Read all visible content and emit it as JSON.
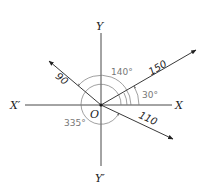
{
  "diagram": {
    "type": "vector force diagram",
    "origin": {
      "label": "O"
    },
    "axes": {
      "x_positive": "X",
      "x_negative": "X′",
      "y_positive": "Y",
      "y_negative": "Y′"
    },
    "vectors": [
      {
        "magnitude": "150",
        "angle": "30°",
        "angle_deg": 30
      },
      {
        "magnitude": "90",
        "angle": "140°",
        "angle_deg": 140
      },
      {
        "magnitude": "110",
        "angle": "335°",
        "angle_deg": 335
      }
    ],
    "colors": {
      "lines": "#222222",
      "angle_arcs": "#777777"
    }
  }
}
